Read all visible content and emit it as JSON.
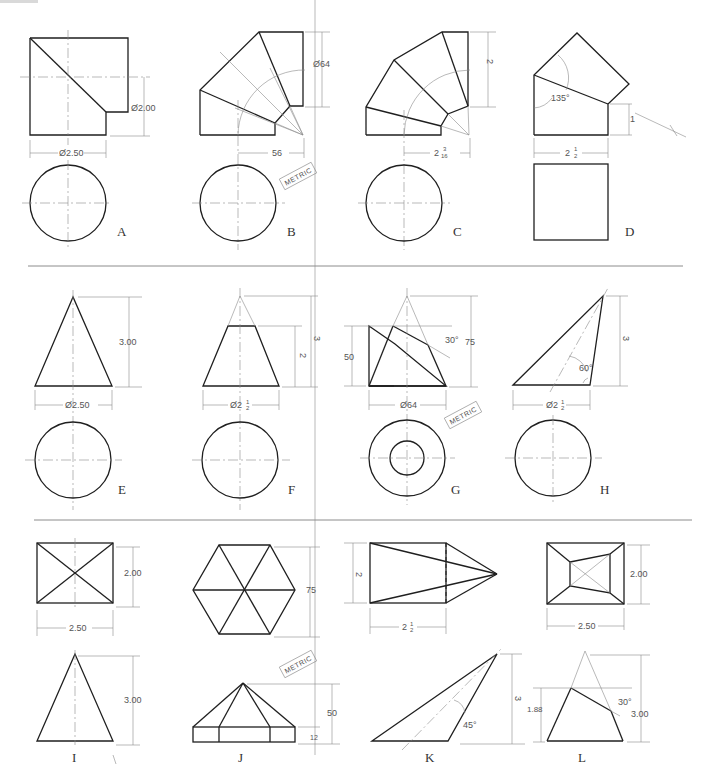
{
  "corner_bar_color": "#d9d9d9",
  "metric_badge": "METRIC",
  "problems": [
    {
      "id": "A",
      "label": "A",
      "dims": [
        "Ø2.00",
        "Ø2.50"
      ]
    },
    {
      "id": "B",
      "label": "B",
      "dims": [
        "Ø64",
        "56"
      ],
      "metric": true
    },
    {
      "id": "C",
      "label": "C",
      "dims": [
        "2 1/2",
        "2 3/16"
      ]
    },
    {
      "id": "D",
      "label": "D",
      "dims": [
        "135°",
        "1",
        "2 1/2"
      ]
    },
    {
      "id": "E",
      "label": "E",
      "dims": [
        "3.00",
        "Ø2.50"
      ]
    },
    {
      "id": "F",
      "label": "F",
      "dims": [
        "3",
        "2",
        "Ø2 1/2"
      ]
    },
    {
      "id": "G",
      "label": "G",
      "dims": [
        "50",
        "75",
        "30°",
        "Ø64"
      ],
      "metric": true
    },
    {
      "id": "H",
      "label": "H",
      "dims": [
        "3",
        "60°",
        "Ø2 1/2"
      ]
    },
    {
      "id": "I",
      "label": "I",
      "dims": [
        "2.00",
        "2.50",
        "3.00"
      ]
    },
    {
      "id": "J",
      "label": "J",
      "dims": [
        "75",
        "50",
        "12"
      ],
      "metric": true
    },
    {
      "id": "K",
      "label": "K",
      "dims": [
        "2",
        "2 1/2",
        "3",
        "45°"
      ]
    },
    {
      "id": "L",
      "label": "L",
      "dims": [
        "2.00",
        "2.50",
        "1.88",
        "30°",
        "3.00"
      ]
    }
  ],
  "text": {
    "a_d1": "Ø2.00",
    "a_d2": "Ø2.50",
    "b_d1": "Ø64",
    "b_d2": "56",
    "c_d1": "2",
    "c_d1f": "1/2",
    "c_d2": "2",
    "c_d2n": "3",
    "c_d2d": "16",
    "d_ang": "135°",
    "d_d1": "1",
    "d_d2": "2",
    "d_d2n": "1",
    "d_d2d": "2",
    "e_d1": "3.00",
    "e_d2": "Ø2.50",
    "f_d1": "3",
    "f_d2": "2",
    "f_d3": "Ø2",
    "f_d3n": "1",
    "f_d3d": "2",
    "g_d1": "50",
    "g_d2": "75",
    "g_ang": "30°",
    "g_d3": "Ø64",
    "h_d1": "3",
    "h_ang": "60°",
    "h_d2": "Ø2",
    "h_d2n": "1",
    "h_d2d": "2",
    "i_d1": "2.00",
    "i_d2": "2.50",
    "i_d3": "3.00",
    "j_d1": "75",
    "j_d2": "50",
    "j_d3": "12",
    "k_d1": "2",
    "k_d2": "2",
    "k_d2n": "1",
    "k_d2d": "2",
    "k_d3": "3",
    "k_ang": "45°",
    "l_d1": "2.00",
    "l_d2": "2.50",
    "l_d3": "1.88",
    "l_ang": "30°",
    "l_d4": "3.00"
  }
}
